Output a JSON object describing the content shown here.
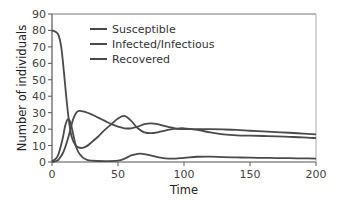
{
  "chart_data": {
    "type": "line",
    "title": "",
    "xlabel": "Time",
    "ylabel": "Number of individuals",
    "xlim": [
      0,
      200
    ],
    "ylim": [
      0,
      90
    ],
    "xticks": [
      0,
      50,
      100,
      150,
      200
    ],
    "yticks": [
      0,
      10,
      20,
      30,
      40,
      50,
      60,
      70,
      80,
      90
    ],
    "grid": false,
    "legend_position": "upper-center",
    "line_color": "#4a4a4a",
    "axis_color": "#777777",
    "series": [
      {
        "name": "Susceptible",
        "x": [
          0,
          3,
          5,
          7,
          9,
          11,
          13,
          15,
          18,
          22,
          26,
          30,
          35,
          40,
          45,
          50,
          55,
          60,
          65,
          70,
          75,
          80,
          85,
          90,
          95,
          100,
          110,
          120,
          130,
          140,
          150,
          160,
          170,
          180,
          190,
          200
        ],
        "values": [
          80,
          79,
          77,
          70,
          55,
          38,
          24,
          15,
          10,
          8.5,
          9.5,
          12,
          15.5,
          19.5,
          23,
          26.5,
          28,
          25,
          20.5,
          18,
          17.5,
          18,
          19,
          19.8,
          20.3,
          20.5,
          19.5,
          18,
          16.8,
          16.2,
          16,
          15.8,
          15.6,
          15.3,
          15,
          14.5
        ]
      },
      {
        "name": "Infected/Infectious",
        "x": [
          0,
          3,
          5,
          8,
          10,
          12,
          14,
          16,
          18,
          20,
          23,
          26,
          30,
          40,
          50,
          55,
          60,
          65,
          68,
          72,
          80,
          90,
          100,
          110,
          120,
          130,
          140,
          150,
          160,
          170,
          180,
          190,
          200
        ],
        "values": [
          0.5,
          2,
          5,
          14,
          22,
          26,
          24,
          17,
          10,
          6,
          3,
          1.5,
          0.8,
          0.5,
          0.8,
          2,
          4,
          5,
          5,
          4.5,
          3,
          2,
          2.5,
          3.2,
          3.3,
          3,
          2.8,
          2.6,
          2.5,
          2.4,
          2.3,
          2.2,
          2.1
        ]
      },
      {
        "name": "Recovered",
        "x": [
          0,
          3,
          5,
          8,
          10,
          12,
          14,
          16,
          18,
          20,
          22,
          25,
          30,
          35,
          40,
          45,
          50,
          55,
          60,
          65,
          70,
          75,
          80,
          85,
          90,
          95,
          100,
          110,
          120,
          130,
          140,
          150,
          160,
          170,
          180,
          190,
          200
        ],
        "values": [
          0,
          0.5,
          1.5,
          5,
          9,
          14,
          20,
          26,
          29.5,
          31,
          31,
          30.5,
          29,
          27,
          25,
          23,
          21.5,
          20.5,
          20.5,
          21.5,
          23,
          23.5,
          23,
          22,
          21,
          20.2,
          20,
          20,
          20,
          19.8,
          19.5,
          19,
          18.6,
          18.2,
          17.8,
          17.3,
          16.8
        ]
      }
    ]
  },
  "legend": {
    "items": [
      {
        "label": "Susceptible"
      },
      {
        "label": "Infected/Infectious"
      },
      {
        "label": "Recovered"
      }
    ]
  },
  "axes": {
    "x_title": "Time",
    "y_title": "Number of individuals",
    "x_tick_labels": [
      "0",
      "50",
      "100",
      "150",
      "200"
    ],
    "y_tick_labels": [
      "0",
      "10",
      "20",
      "30",
      "40",
      "50",
      "60",
      "70",
      "80",
      "90"
    ]
  }
}
